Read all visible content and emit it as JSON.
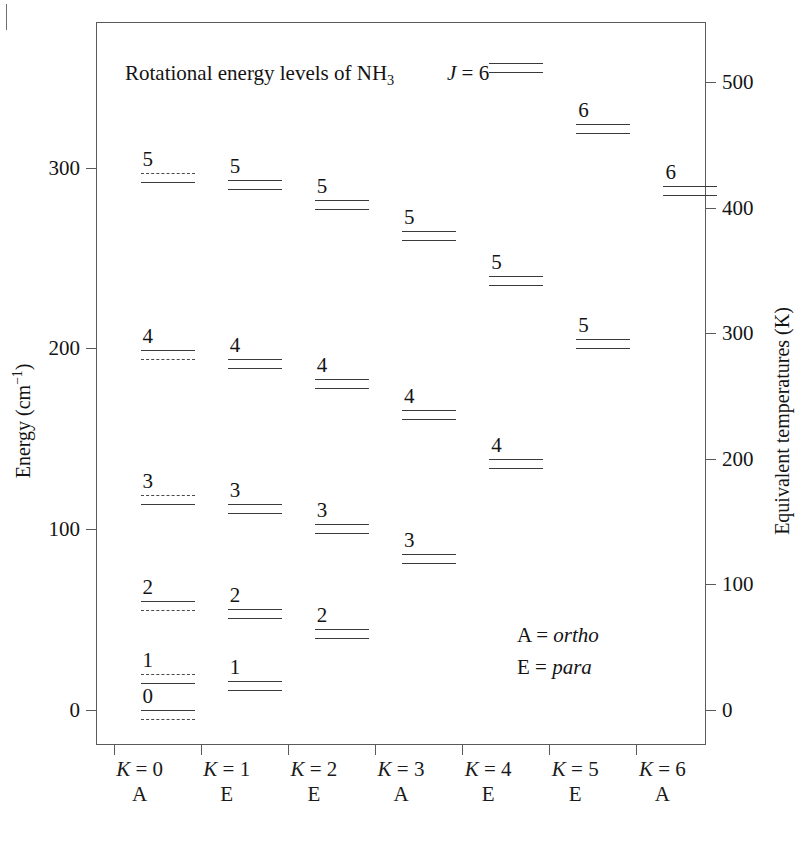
{
  "chart_data": {
    "type": "scatter",
    "title": "Rotational energy levels of NH3",
    "title_rich": {
      "prefix": "Rotational energy levels of NH",
      "subscript": "3"
    },
    "xlabel": "",
    "ylabel": "Energy (cm^-1)",
    "ylabel_rich": {
      "text": "Energy (cm",
      "sup": "−1",
      "tail": ")"
    },
    "y2label": "Equivalent temperatures (K)",
    "ylim": [
      -20,
      380
    ],
    "yticks": [
      0,
      100,
      200,
      300
    ],
    "yticklabels": [
      "0",
      "100",
      "200",
      "300"
    ],
    "y2lim": [
      -29,
      547
    ],
    "y2ticks": [
      0,
      100,
      200,
      300,
      400,
      500
    ],
    "y2ticklabels": [
      "0",
      "100",
      "200",
      "300",
      "400",
      "500"
    ],
    "grid": false,
    "legend_position": "inside-lower-right",
    "j_annotation": "J = 6",
    "legend": [
      {
        "symbol": "A",
        "equals": "=",
        "meaning": "ortho"
      },
      {
        "symbol": "E",
        "equals": "=",
        "meaning": "para"
      }
    ],
    "columns": [
      {
        "k": 0,
        "k_label": "K = 0",
        "symmetry": "A",
        "levels": [
          {
            "j": 5,
            "j_label": "5",
            "energy": 297,
            "lines": [
              "dashed",
              "solid"
            ]
          },
          {
            "j": 4,
            "j_label": "4",
            "energy": 199,
            "lines": [
              "solid",
              "dashed"
            ]
          },
          {
            "j": 3,
            "j_label": "3",
            "energy": 119,
            "lines": [
              "dashed",
              "solid"
            ]
          },
          {
            "j": 2,
            "j_label": "2",
            "energy": 60,
            "lines": [
              "solid",
              "dashed"
            ]
          },
          {
            "j": 1,
            "j_label": "1",
            "energy": 20,
            "lines": [
              "dashed",
              "solid"
            ]
          },
          {
            "j": 0,
            "j_label": "0",
            "energy": 0,
            "lines": [
              "solid",
              "dashed"
            ]
          }
        ]
      },
      {
        "k": 1,
        "k_label": "K = 1",
        "symmetry": "E",
        "levels": [
          {
            "j": 5,
            "j_label": "5",
            "energy": 293,
            "lines": [
              "solid",
              "solid"
            ]
          },
          {
            "j": 4,
            "j_label": "4",
            "energy": 194,
            "lines": [
              "solid",
              "solid"
            ]
          },
          {
            "j": 3,
            "j_label": "3",
            "energy": 114,
            "lines": [
              "solid",
              "solid"
            ]
          },
          {
            "j": 2,
            "j_label": "2",
            "energy": 56,
            "lines": [
              "solid",
              "solid"
            ]
          },
          {
            "j": 1,
            "j_label": "1",
            "energy": 16,
            "lines": [
              "solid",
              "solid"
            ]
          }
        ]
      },
      {
        "k": 2,
        "k_label": "K = 2",
        "symmetry": "E",
        "levels": [
          {
            "j": 5,
            "j_label": "5",
            "energy": 282,
            "lines": [
              "solid",
              "solid"
            ]
          },
          {
            "j": 4,
            "j_label": "4",
            "energy": 183,
            "lines": [
              "solid",
              "solid"
            ]
          },
          {
            "j": 3,
            "j_label": "3",
            "energy": 103,
            "lines": [
              "solid",
              "solid"
            ]
          },
          {
            "j": 2,
            "j_label": "2",
            "energy": 45,
            "lines": [
              "solid",
              "solid"
            ]
          }
        ]
      },
      {
        "k": 3,
        "k_label": "K = 3",
        "symmetry": "A",
        "levels": [
          {
            "j": 5,
            "j_label": "5",
            "energy": 265,
            "lines": [
              "solid",
              "solid"
            ]
          },
          {
            "j": 4,
            "j_label": "4",
            "energy": 166,
            "lines": [
              "solid",
              "solid"
            ]
          },
          {
            "j": 3,
            "j_label": "3",
            "energy": 86,
            "lines": [
              "solid",
              "solid"
            ]
          }
        ]
      },
      {
        "k": 4,
        "k_label": "K = 4",
        "symmetry": "E",
        "levels": [
          {
            "j": 6,
            "j_label": "",
            "energy": 358,
            "lines": [
              "solid",
              "solid"
            ]
          },
          {
            "j": 5,
            "j_label": "5",
            "energy": 240,
            "lines": [
              "solid",
              "solid"
            ]
          },
          {
            "j": 4,
            "j_label": "4",
            "energy": 139,
            "lines": [
              "solid",
              "solid"
            ]
          }
        ]
      },
      {
        "k": 5,
        "k_label": "K = 5",
        "symmetry": "E",
        "levels": [
          {
            "j": 6,
            "j_label": "6",
            "energy": 324,
            "lines": [
              "solid",
              "solid"
            ]
          },
          {
            "j": 5,
            "j_label": "5",
            "energy": 205,
            "lines": [
              "solid",
              "solid"
            ]
          }
        ]
      },
      {
        "k": 6,
        "k_label": "K = 6",
        "symmetry": "A",
        "levels": [
          {
            "j": 6,
            "j_label": "6",
            "energy": 290,
            "lines": [
              "solid",
              "solid"
            ]
          }
        ]
      }
    ]
  }
}
